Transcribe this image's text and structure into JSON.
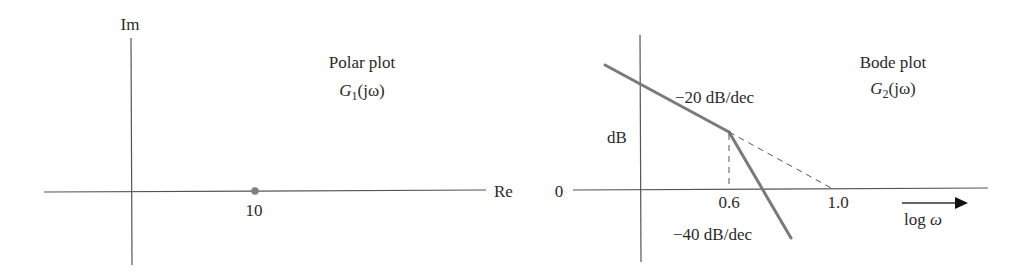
{
  "polar_plot": {
    "title": "Polar plot",
    "function_prefix": "G",
    "function_subscript": "1",
    "function_suffix": "(jω)",
    "axis_labels": {
      "imag": "Im",
      "real": "Re"
    },
    "point": {
      "label": "10",
      "real": 10,
      "imag": 0
    },
    "colors": {
      "axis": "#555555",
      "point": "#808080"
    }
  },
  "bode_plot": {
    "title": "Bode plot",
    "function_prefix": "G",
    "function_subscript": "2",
    "function_suffix": "(jω)",
    "y_axis_label": "dB",
    "y_zero_label": "0",
    "x_axis_label": "log ω",
    "x_ticks": [
      "0.6",
      "1.0"
    ],
    "slopes": [
      {
        "label": "−20 dB/dec",
        "value": -20
      },
      {
        "label": "−40 dB/dec",
        "value": -40
      }
    ],
    "break_frequency": 0.6,
    "extrapolated_crossover": 1.0,
    "colors": {
      "axis": "#555555",
      "curve": "#7a7a7a"
    }
  }
}
